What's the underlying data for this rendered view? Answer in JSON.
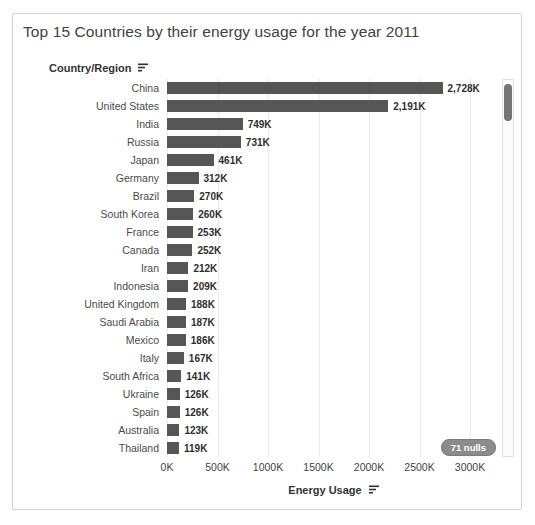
{
  "title": "Top 15 Countries by their energy usage for the year 2011",
  "row_axis": {
    "label": "Country/Region",
    "sort_icon": "sort-descending-icon"
  },
  "value_axis": {
    "label": "Energy Usage",
    "sort_icon": "sort-descending-icon"
  },
  "nulls_badge": "71 nulls",
  "colors": {
    "bar": "#565656",
    "gridline": "#e9e9e9",
    "nulls_pill_bg": "#8b8b8b",
    "scroll_thumb": "#757575"
  },
  "chart_data": {
    "type": "bar",
    "orientation": "horizontal",
    "title": "Top 15 Countries by their energy usage for the year 2011",
    "row_axis_label": "Country/Region",
    "value_axis_label": "Energy Usage",
    "categories": [
      "China",
      "United States",
      "India",
      "Russia",
      "Japan",
      "Germany",
      "Brazil",
      "South Korea",
      "France",
      "Canada",
      "Iran",
      "Indonesia",
      "United Kingdom",
      "Saudi Arabia",
      "Mexico",
      "Italy",
      "South Africa",
      "Ukraine",
      "Spain",
      "Australia",
      "Thailand"
    ],
    "values_k": [
      2728,
      2191,
      749,
      731,
      461,
      312,
      270,
      260,
      253,
      252,
      212,
      209,
      188,
      187,
      186,
      167,
      141,
      126,
      126,
      123,
      119
    ],
    "value_labels": [
      "2,728K",
      "2,191K",
      "749K",
      "731K",
      "461K",
      "312K",
      "270K",
      "260K",
      "253K",
      "252K",
      "212K",
      "209K",
      "188K",
      "187K",
      "186K",
      "167K",
      "141K",
      "126K",
      "126K",
      "123K",
      "119K"
    ],
    "x_ticks": [
      "0K",
      "500K",
      "1000K",
      "1500K",
      "2000K",
      "2500K",
      "3000K"
    ],
    "xlim_k": [
      0,
      3000
    ],
    "grid": "vertical-on",
    "legend": "none",
    "bar_color": "#565656",
    "annotations": [
      "71 nulls"
    ]
  }
}
